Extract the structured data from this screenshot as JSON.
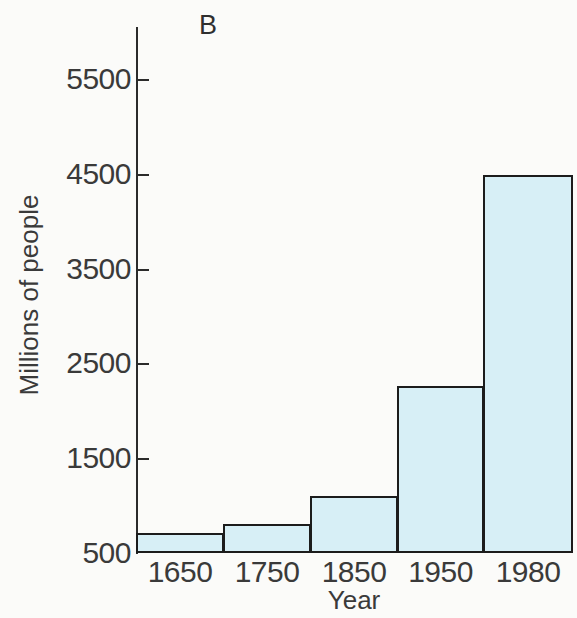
{
  "figure": {
    "panel_label": "B"
  },
  "chart_data": {
    "type": "bar",
    "title": "B",
    "xlabel": "Year",
    "ylabel": "Millions of people",
    "categories": [
      "1650",
      "1750",
      "1850",
      "1950",
      "1980"
    ],
    "values": [
      710,
      806,
      1100,
      2265,
      4485
    ],
    "yticks": [
      "500",
      "1500",
      "2500",
      "3500",
      "4500",
      "5500"
    ],
    "ytick_values": [
      500,
      1500,
      2500,
      3500,
      4500,
      5500
    ],
    "ylim": [
      500,
      5800
    ],
    "grid": false,
    "legend": null,
    "bar_fill_color": "#d7eff6",
    "bar_edge_color": "#1c1c1c",
    "axis_color": "#2b2b2b",
    "text_color": "#3a3a3a",
    "background_color": "#fbfbf9"
  }
}
